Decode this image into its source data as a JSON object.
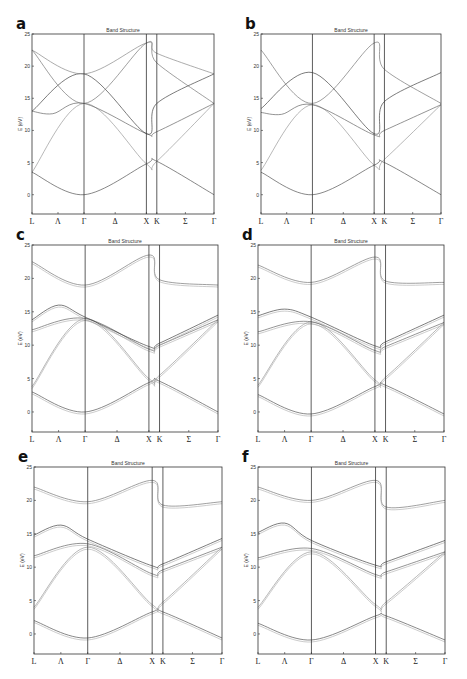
{
  "figure": {
    "panels": [
      {
        "letter": "a",
        "title": "Band Structure"
      },
      {
        "letter": "b",
        "title": "Band Structure"
      },
      {
        "letter": "c",
        "title": "Band Structure"
      },
      {
        "letter": "d",
        "title": "Band Structure"
      },
      {
        "letter": "e",
        "title": "Band Structure"
      },
      {
        "letter": "f",
        "title": "Band Structure"
      }
    ]
  },
  "chart_data": [
    {
      "type": "line",
      "panel": "a",
      "title": "Band Structure",
      "xlabel": "",
      "ylabel": "E (eV)",
      "ylim": [
        -3,
        25
      ],
      "yticks": [
        0,
        5,
        10,
        15,
        20,
        25
      ],
      "x_ticks": [
        "L",
        "Λ",
        "Γ",
        "Δ",
        "X",
        "K",
        "Σ",
        "Γ"
      ],
      "x_tick_pos": [
        0,
        0.5,
        1,
        1.6,
        2.2,
        2.4,
        2.95,
        3.5
      ],
      "vlines_at": [
        "Γ",
        "X",
        "K"
      ],
      "grid": false,
      "series": [
        {
          "name": "band1",
          "x": [
            0,
            1,
            2.2,
            2.4,
            3.5
          ],
          "y": [
            3.5,
            0,
            4.8,
            5.2,
            0
          ]
        },
        {
          "name": "band2",
          "x": [
            0,
            1,
            2.2,
            2.4,
            3.5
          ],
          "y": [
            3.5,
            14.2,
            4.8,
            5.2,
            14.2
          ]
        },
        {
          "name": "band3",
          "x": [
            0,
            0.4,
            1,
            2.2,
            2.4,
            3.5
          ],
          "y": [
            13.0,
            12.6,
            14.2,
            9.5,
            9.8,
            14.2
          ]
        },
        {
          "name": "band4",
          "x": [
            0,
            1,
            2.2,
            2.4,
            3.5
          ],
          "y": [
            13.0,
            18.8,
            9.5,
            14.2,
            18.8
          ]
        },
        {
          "name": "band5",
          "x": [
            0,
            1,
            2.2,
            2.4,
            3.5
          ],
          "y": [
            22.5,
            14.2,
            23.6,
            20.5,
            14.2
          ]
        },
        {
          "name": "band6",
          "x": [
            0,
            1,
            2.2,
            2.4,
            3.5
          ],
          "y": [
            22.5,
            18.8,
            23.6,
            22.0,
            18.8
          ]
        }
      ]
    },
    {
      "type": "line",
      "panel": "b",
      "title": "Band Structure",
      "ylabel": "E (eV)",
      "ylim": [
        -3,
        25
      ],
      "yticks": [
        0,
        5,
        10,
        15,
        20,
        25
      ],
      "x_ticks": [
        "L",
        "Λ",
        "Γ",
        "Δ",
        "X",
        "K",
        "Σ",
        "Γ"
      ],
      "series": [
        {
          "name": "band1",
          "x": [
            0,
            1,
            2.2,
            2.4,
            3.5
          ],
          "y": [
            3.5,
            0,
            4.6,
            5.0,
            0
          ]
        },
        {
          "name": "band2",
          "x": [
            0,
            1,
            2.2,
            2.4,
            3.5
          ],
          "y": [
            3.8,
            14.0,
            4.6,
            5.5,
            14.0
          ]
        },
        {
          "name": "band3",
          "x": [
            0,
            0.4,
            1,
            2.2,
            2.4,
            3.5
          ],
          "y": [
            12.8,
            12.5,
            14.0,
            9.3,
            10.0,
            14.0
          ]
        },
        {
          "name": "band4",
          "x": [
            0,
            1,
            2.2,
            2.4,
            3.5
          ],
          "y": [
            13.4,
            19.0,
            9.5,
            14.5,
            19.0
          ]
        },
        {
          "name": "band5",
          "x": [
            0,
            1,
            2.2,
            2.4,
            3.5
          ],
          "y": [
            22.5,
            14.2,
            23.6,
            19.5,
            14.2
          ]
        }
      ]
    },
    {
      "type": "line",
      "panel": "c",
      "title": "Band Structure",
      "ylabel": "E (eV)",
      "ylim": [
        -3,
        25
      ],
      "yticks": [
        0,
        5,
        10,
        15,
        20,
        25
      ],
      "x_ticks": [
        "L",
        "Λ",
        "Γ",
        "Δ",
        "X",
        "K",
        "Σ",
        "Γ"
      ],
      "series": [
        {
          "name": "band1",
          "x": [
            0,
            1,
            2.2,
            2.4,
            3.5
          ],
          "y": [
            3.0,
            0,
            4.4,
            4.6,
            0
          ]
        },
        {
          "name": "band2",
          "x": [
            0,
            1,
            2.2,
            2.4,
            3.5
          ],
          "y": [
            3.8,
            14.0,
            5.0,
            5.5,
            13.8
          ]
        },
        {
          "name": "band3",
          "x": [
            0,
            1,
            2.2,
            2.4,
            3.5
          ],
          "y": [
            12.3,
            14.0,
            9.4,
            10.0,
            13.8
          ]
        },
        {
          "name": "band4",
          "x": [
            0,
            0.5,
            1,
            2.2,
            2.4,
            3.5
          ],
          "y": [
            13.8,
            16.0,
            14.2,
            9.8,
            10.3,
            14.5
          ]
        },
        {
          "name": "band5",
          "x": [
            0,
            1,
            2.2,
            2.4,
            3.5
          ],
          "y": [
            22.5,
            19.0,
            23.5,
            19.8,
            19.0
          ]
        }
      ]
    },
    {
      "type": "line",
      "panel": "d",
      "title": "Band Structure",
      "ylabel": "E (eV)",
      "ylim": [
        -3,
        25
      ],
      "yticks": [
        0,
        5,
        10,
        15,
        20,
        25
      ],
      "x_ticks": [
        "L",
        "Λ",
        "Γ",
        "Δ",
        "X",
        "K",
        "Σ",
        "Γ"
      ],
      "series": [
        {
          "name": "band1",
          "x": [
            0,
            1,
            2.2,
            2.4,
            3.5
          ],
          "y": [
            2.6,
            -0.3,
            3.8,
            4.0,
            -0.3
          ]
        },
        {
          "name": "band2",
          "x": [
            0,
            1,
            2.2,
            2.4,
            3.5
          ],
          "y": [
            4.0,
            13.5,
            4.8,
            5.2,
            13.4
          ]
        },
        {
          "name": "band3",
          "x": [
            0,
            1,
            2.2,
            2.4,
            3.5
          ],
          "y": [
            12.0,
            13.5,
            9.2,
            9.8,
            13.4
          ]
        },
        {
          "name": "band4",
          "x": [
            0,
            0.5,
            1,
            2.2,
            2.4,
            3.5
          ],
          "y": [
            14.4,
            15.4,
            14.2,
            9.9,
            10.5,
            14.5
          ]
        },
        {
          "name": "band5",
          "x": [
            0,
            1,
            2.2,
            2.4,
            3.5
          ],
          "y": [
            22.0,
            19.4,
            23.2,
            19.6,
            19.4
          ]
        }
      ]
    },
    {
      "type": "line",
      "panel": "e",
      "title": "Band Structure",
      "ylabel": "E (eV)",
      "ylim": [
        -3,
        25
      ],
      "yticks": [
        0,
        5,
        10,
        15,
        20,
        25
      ],
      "x_ticks": [
        "L",
        "Λ",
        "Γ",
        "Δ",
        "X",
        "K",
        "Σ",
        "Γ"
      ],
      "series": [
        {
          "name": "band1",
          "x": [
            0,
            1,
            2.2,
            2.4,
            3.5
          ],
          "y": [
            2.0,
            -0.6,
            3.3,
            3.3,
            -0.6
          ]
        },
        {
          "name": "band2",
          "x": [
            0,
            1,
            2.2,
            2.4,
            3.5
          ],
          "y": [
            4.0,
            13.0,
            4.4,
            4.8,
            13.0
          ]
        },
        {
          "name": "band3",
          "x": [
            0,
            1,
            2.2,
            2.4,
            3.5
          ],
          "y": [
            11.7,
            13.5,
            9.0,
            9.6,
            13.0
          ]
        },
        {
          "name": "band4",
          "x": [
            0,
            0.5,
            1,
            2.2,
            2.4,
            3.5
          ],
          "y": [
            14.8,
            16.3,
            14.2,
            10.2,
            10.5,
            14.3
          ]
        },
        {
          "name": "band5",
          "x": [
            0,
            1,
            2.2,
            2.4,
            3.5
          ],
          "y": [
            22.0,
            19.8,
            23.0,
            19.3,
            19.8
          ]
        }
      ]
    },
    {
      "type": "line",
      "panel": "f",
      "title": "Band Structure",
      "ylabel": "E (eV)",
      "ylim": [
        -3,
        25
      ],
      "yticks": [
        0,
        5,
        10,
        15,
        20,
        25
      ],
      "x_ticks": [
        "L",
        "Λ",
        "Γ",
        "Δ",
        "X",
        "K",
        "Σ",
        "Γ"
      ],
      "series": [
        {
          "name": "band1",
          "x": [
            0,
            1,
            2.2,
            2.4,
            3.5
          ],
          "y": [
            1.6,
            -0.9,
            2.7,
            2.7,
            -0.9
          ]
        },
        {
          "name": "band2",
          "x": [
            0,
            1,
            2.2,
            2.4,
            3.5
          ],
          "y": [
            4.0,
            12.3,
            4.4,
            4.8,
            12.3
          ]
        },
        {
          "name": "band3",
          "x": [
            0,
            1,
            2.2,
            2.4,
            3.5
          ],
          "y": [
            11.4,
            12.8,
            8.9,
            9.3,
            12.3
          ]
        },
        {
          "name": "band4",
          "x": [
            0,
            0.5,
            1,
            2.2,
            2.4,
            3.5
          ],
          "y": [
            15.2,
            16.6,
            14.0,
            10.3,
            10.8,
            14.0
          ]
        },
        {
          "name": "band5",
          "x": [
            0,
            1,
            2.2,
            2.4,
            3.5
          ],
          "y": [
            22.0,
            20.0,
            23.0,
            19.0,
            20.0
          ]
        }
      ]
    }
  ]
}
